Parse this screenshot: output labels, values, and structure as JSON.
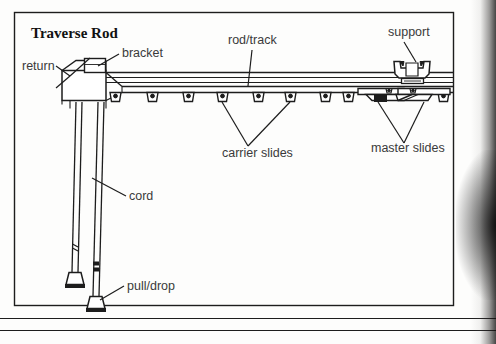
{
  "document": {
    "title": "Traverse Rod",
    "type": "technical-line-diagram",
    "subject": "curtain traverse rod assembly, side elevation"
  },
  "frame": {
    "inner_border": {
      "x": 14,
      "y": 12,
      "width": 440,
      "height": 294,
      "color": "#1d1d1d"
    },
    "page_rules": [
      {
        "y": 318,
        "x1": 0,
        "x2": 496
      },
      {
        "y": 330,
        "x1": 0,
        "x2": 496
      }
    ],
    "scan_shadow_side": "right"
  },
  "labels": [
    {
      "id": "return",
      "text": "return",
      "x": 22,
      "y": 70,
      "anchor": "start",
      "leader": "y-fork"
    },
    {
      "id": "bracket",
      "text": "bracket",
      "x": 122,
      "y": 57,
      "anchor": "start",
      "leader": "diagonal"
    },
    {
      "id": "rod-track",
      "text": "rod/track",
      "x": 228,
      "y": 44,
      "anchor": "start",
      "leader": "diagonal"
    },
    {
      "id": "support",
      "text": "support",
      "x": 388,
      "y": 36,
      "anchor": "start",
      "leader": "diagonal"
    },
    {
      "id": "carrier-slides",
      "text": "carrier slides",
      "x": 222,
      "y": 157,
      "anchor": "start",
      "leader": "v-fork"
    },
    {
      "id": "master-slides",
      "text": "master slides",
      "x": 371,
      "y": 152,
      "anchor": "start",
      "leader": "v-fork"
    },
    {
      "id": "cord",
      "text": "cord",
      "x": 129,
      "y": 200,
      "anchor": "start",
      "leader": "diagonal"
    },
    {
      "id": "pull-drop",
      "text": "pull/drop",
      "x": 127,
      "y": 290,
      "anchor": "start",
      "leader": "diagonal"
    }
  ],
  "assembly": {
    "rod": {
      "label": "rod/track",
      "top_y": 72,
      "bottom_y": 92,
      "left_x": 60,
      "right_x": 454,
      "rail_lines_y": [
        72,
        77,
        82,
        86,
        92
      ]
    },
    "end_return": {
      "label": "return",
      "description": "boxed left end cap of the traverse rod",
      "x": 62,
      "y": 70,
      "width": 44,
      "height": 30
    },
    "bracket": {
      "label": "bracket",
      "description": "mounting bracket block on top of rod left end",
      "x": 84,
      "y": 58,
      "width": 22,
      "height": 16
    },
    "support": {
      "label": "support",
      "description": "bowtie / butterfly ceiling support clamp straddling the rod",
      "center_x": 412,
      "y": 60,
      "width": 36,
      "height": 26
    },
    "carrier_slides": {
      "label": "carrier slides",
      "description": "small trapezoid hooks hanging from the track underside",
      "count": 9,
      "x_positions": [
        115,
        152,
        188,
        222,
        258,
        290,
        325,
        348,
        443
      ],
      "y": 88,
      "width": 13,
      "height": 10
    },
    "master_slides": {
      "label": "master slides",
      "description": "overlapping pair of master carriers at center-right of track",
      "x": 358,
      "y": 88,
      "width": 92,
      "height": 16
    },
    "cords": {
      "label": "cord",
      "description": "two vertical pull cords descending from the left end of the rod",
      "lines": [
        {
          "x_top": 78,
          "x_bottom": 74,
          "y_top": 100,
          "y_bottom": 272,
          "weight_y": 272
        },
        {
          "x_top": 100,
          "x_bottom": 95,
          "y_top": 100,
          "y_bottom": 296,
          "weight_y": 296
        }
      ],
      "knot_marks": [
        {
          "x": 74,
          "y": 248
        },
        {
          "x": 94,
          "y": 266
        }
      ]
    },
    "pull_drops": {
      "label": "pull/drop",
      "description": "bell-shaped cord weights at the bottom of each cord",
      "items": [
        {
          "x": 74,
          "y": 272,
          "width": 18,
          "height": 13
        },
        {
          "x": 95,
          "y": 296,
          "width": 18,
          "height": 13
        }
      ]
    }
  },
  "colors": {
    "ink": "#1d1d1d",
    "label_text": "#3a3a3a",
    "paper": "#fdfdfc"
  }
}
